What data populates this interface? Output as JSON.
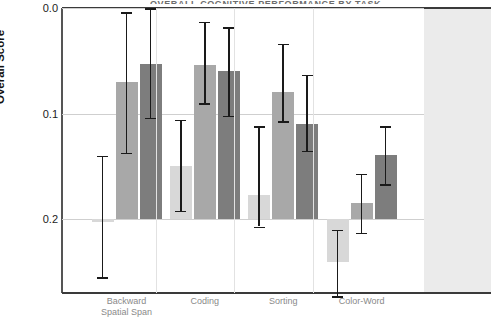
{
  "title_sliver": "OVERALL COGNITIVE PERFORMANCE BY TASK",
  "axis": {
    "ylabel": "Overall Score",
    "yticks": [
      "0.2",
      "0.1",
      "0.0"
    ]
  },
  "chart_data": {
    "type": "bar",
    "title": "",
    "xlabel": "",
    "ylabel": "Overall Score",
    "ylim": [
      -0.07,
      0.215
    ],
    "yticks": [
      0.0,
      0.1,
      0.2
    ],
    "grid": true,
    "legend_position": "right",
    "categories": [
      "Backward\nSpatial Span",
      "Coding",
      "Sorting",
      "Color-Word"
    ],
    "series": [
      {
        "name": "series-1",
        "color": "#d8d8d8",
        "values": [
          -0.003,
          0.05,
          0.023,
          -0.041
        ],
        "err_low": [
          -0.055,
          0.008,
          -0.007,
          -0.073
        ],
        "err_high": [
          0.06,
          0.094,
          0.088,
          -0.01
        ]
      },
      {
        "name": "series-2",
        "color": "#a8a8a8",
        "values": [
          0.13,
          0.146,
          0.12,
          0.015
        ],
        "err_low": [
          0.063,
          0.11,
          0.093,
          -0.013
        ],
        "err_high": [
          0.196,
          0.187,
          0.166,
          0.043
        ]
      },
      {
        "name": "series-3",
        "color": "#7d7d7d",
        "values": [
          0.147,
          0.14,
          0.09,
          0.061
        ],
        "err_low": [
          0.096,
          0.098,
          0.065,
          0.033
        ],
        "err_high": [
          0.2,
          0.182,
          0.137,
          0.088
        ]
      }
    ]
  }
}
